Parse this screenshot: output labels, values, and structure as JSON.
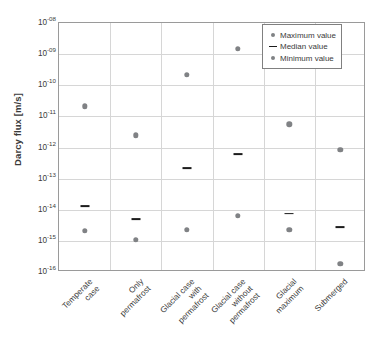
{
  "chart_data": {
    "type": "scatter",
    "title": "",
    "xlabel": "",
    "ylabel": "Darcy flux [m/s]",
    "yscale": "log",
    "ylim": [
      1e-16,
      1e-08
    ],
    "grid": true,
    "legend_position": "top-right",
    "ytick_labels": [
      "10-08",
      "10-09",
      "10-10",
      "10-11",
      "10-12",
      "10-13",
      "10-14",
      "10-15",
      "10-16"
    ],
    "ytick_mantissa": "10",
    "ytick_exponents": [
      "-08",
      "-09",
      "-10",
      "-11",
      "-12",
      "-13",
      "-14",
      "-15",
      "-16"
    ],
    "ytick_values": [
      1e-08,
      1e-09,
      1e-10,
      1e-11,
      1e-12,
      1e-13,
      1e-14,
      1e-15,
      1e-16
    ],
    "categories": [
      "Temperate\ncase",
      "Only\npermafrost",
      "Glacial case\nwith\npermafrost",
      "Glacial case\nwithout\npermafrost",
      "Glacial\nmaximum",
      "Submerged"
    ],
    "series": [
      {
        "name": "Maximum value",
        "marker": "dot",
        "color": "#808285",
        "values": [
          2.1e-11,
          2.5e-12,
          2.2e-10,
          1.5e-09,
          5.5e-12,
          8.5e-13
        ]
      },
      {
        "name": "Median value",
        "marker": "dash",
        "color": "#1c1c1c",
        "values": [
          1.3e-14,
          5e-15,
          2.2e-13,
          6e-13,
          7.5e-15,
          2.7e-15
        ]
      },
      {
        "name": "Minimum value",
        "marker": "dot",
        "color": "#808285",
        "values": [
          2.1e-15,
          1.1e-15,
          2.3e-15,
          6.5e-15,
          2.3e-15,
          1.8e-16
        ]
      }
    ]
  },
  "axis": {
    "y_title": "Darcy flux [m/s]"
  },
  "legend": {
    "items": [
      {
        "label": "Maximum value",
        "symbol": "dot"
      },
      {
        "label": "Median value",
        "symbol": "dash"
      },
      {
        "label": "Minimum value",
        "symbol": "dot"
      }
    ]
  },
  "colors": {
    "marker_gray": "#808285",
    "marker_dark": "#1c1c1c",
    "gridline": "#d6d6d6",
    "axis_border": "#9a9a9a",
    "text": "#3b3b3b",
    "background": "#ffffff"
  }
}
